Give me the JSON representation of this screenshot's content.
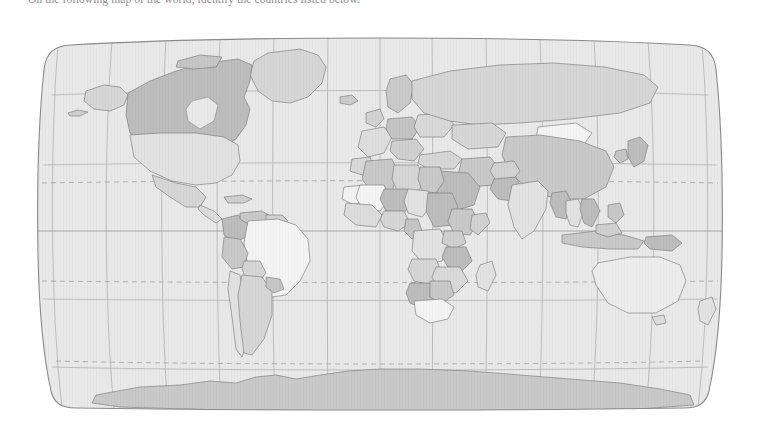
{
  "document": {
    "instruction_text": "On the following map of the world, identify the countries listed below.",
    "background_color": "#ffffff"
  },
  "map": {
    "title": "World Map",
    "projection": "robinson",
    "ocean_color": "#e9e9e9",
    "border_color": "#8a8a8a",
    "graticule_color": "#b0b0b0",
    "country_outline_color": "#7d7d7d",
    "equator_label": "Equator",
    "tropic_of_cancer_label": "Tropic of Cancer",
    "tropic_of_capricorn_label": "Tropic of Capricorn",
    "antarctic_label": "Antarctica",
    "fill_palette": {
      "lightest": "#f4f4f4",
      "very_light": "#ededed",
      "light": "#e2e2e2",
      "medium_light": "#d6d6d6",
      "medium": "#c9c9c9",
      "medium_dark": "#bdbdbd",
      "dark": "#b0b0b0"
    },
    "graticule": {
      "meridian_interval_degrees": 30,
      "parallel_interval_degrees": 30,
      "solid_lines": [
        "equator"
      ],
      "dashed_lines": [
        "tropic_of_cancer",
        "tropic_of_capricorn"
      ]
    },
    "regions": [
      {
        "name": "canada",
        "shade": "medium_dark"
      },
      {
        "name": "united-states",
        "shade": "light"
      },
      {
        "name": "greenland",
        "shade": "medium_light"
      },
      {
        "name": "alaska",
        "shade": "medium_light"
      },
      {
        "name": "mexico",
        "shade": "medium_light"
      },
      {
        "name": "brazil",
        "shade": "lightest"
      },
      {
        "name": "colombia",
        "shade": "medium_dark"
      },
      {
        "name": "venezuela",
        "shade": "medium"
      },
      {
        "name": "peru",
        "shade": "medium"
      },
      {
        "name": "bolivia",
        "shade": "medium_light"
      },
      {
        "name": "argentina",
        "shade": "medium_light"
      },
      {
        "name": "chile",
        "shade": "light"
      },
      {
        "name": "algeria",
        "shade": "medium"
      },
      {
        "name": "libya",
        "shade": "medium_light"
      },
      {
        "name": "egypt",
        "shade": "medium"
      },
      {
        "name": "niger",
        "shade": "medium_dark"
      },
      {
        "name": "mali",
        "shade": "lightest"
      },
      {
        "name": "chad",
        "shade": "light"
      },
      {
        "name": "sudan",
        "shade": "medium_dark"
      },
      {
        "name": "ethiopia",
        "shade": "medium"
      },
      {
        "name": "nigeria",
        "shade": "medium_light"
      },
      {
        "name": "dr-congo",
        "shade": "light"
      },
      {
        "name": "tanzania",
        "shade": "medium_dark"
      },
      {
        "name": "angola",
        "shade": "medium_light"
      },
      {
        "name": "namibia",
        "shade": "medium_dark"
      },
      {
        "name": "botswana",
        "shade": "medium"
      },
      {
        "name": "south-africa",
        "shade": "lightest"
      },
      {
        "name": "madagascar",
        "shade": "light"
      },
      {
        "name": "saudi-arabia",
        "shade": "medium_dark"
      },
      {
        "name": "iran",
        "shade": "medium"
      },
      {
        "name": "turkey",
        "shade": "medium_light"
      },
      {
        "name": "russia",
        "shade": "medium_light"
      },
      {
        "name": "kazakhstan",
        "shade": "medium_light"
      },
      {
        "name": "mongolia",
        "shade": "lightest"
      },
      {
        "name": "china",
        "shade": "medium"
      },
      {
        "name": "india",
        "shade": "light"
      },
      {
        "name": "pakistan",
        "shade": "medium_dark"
      },
      {
        "name": "myanmar",
        "shade": "medium_dark"
      },
      {
        "name": "thailand",
        "shade": "light"
      },
      {
        "name": "vietnam",
        "shade": "medium_dark"
      },
      {
        "name": "indonesia",
        "shade": "medium"
      },
      {
        "name": "japan",
        "shade": "medium_dark"
      },
      {
        "name": "australia",
        "shade": "very_light"
      },
      {
        "name": "new-zealand",
        "shade": "light"
      },
      {
        "name": "papua-new-guinea",
        "shade": "medium_dark"
      },
      {
        "name": "antarctica",
        "shade": "medium"
      }
    ]
  }
}
